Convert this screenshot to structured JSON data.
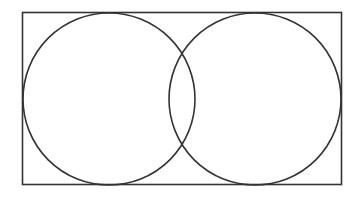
{
  "diagram": {
    "type": "venn",
    "universe": {
      "label": ""
    },
    "sets": [
      {
        "id": "A",
        "label": ""
      },
      {
        "id": "B",
        "label": ""
      }
    ],
    "overlap": "partial",
    "colors": {
      "stroke": "#333333",
      "background": "#ffffff"
    }
  }
}
